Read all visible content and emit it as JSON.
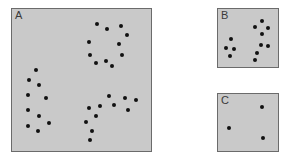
{
  "panels": [
    {
      "id": "A",
      "label": "A",
      "box": {
        "x": 11,
        "y": 8,
        "w": 141,
        "h": 144
      },
      "dots": [
        [
          97,
          24
        ],
        [
          107,
          29
        ],
        [
          121,
          26
        ],
        [
          127,
          35
        ],
        [
          89,
          42
        ],
        [
          119,
          44
        ],
        [
          90,
          55
        ],
        [
          122,
          55
        ],
        [
          96,
          63
        ],
        [
          106,
          61
        ],
        [
          112,
          66
        ],
        [
          36,
          70
        ],
        [
          29,
          80
        ],
        [
          39,
          85
        ],
        [
          28,
          95
        ],
        [
          46,
          98
        ],
        [
          28,
          110
        ],
        [
          39,
          116
        ],
        [
          49,
          123
        ],
        [
          28,
          126
        ],
        [
          38,
          131
        ],
        [
          109,
          96
        ],
        [
          125,
          98
        ],
        [
          136,
          100
        ],
        [
          100,
          106
        ],
        [
          114,
          105
        ],
        [
          128,
          110
        ],
        [
          89,
          108
        ],
        [
          96,
          116
        ],
        [
          86,
          122
        ],
        [
          92,
          131
        ],
        [
          90,
          140
        ]
      ]
    },
    {
      "id": "B",
      "label": "B",
      "box": {
        "x": 217,
        "y": 8,
        "w": 62,
        "h": 60
      },
      "dots": [
        [
          262,
          21
        ],
        [
          255,
          27
        ],
        [
          268,
          28
        ],
        [
          262,
          34
        ],
        [
          231,
          39
        ],
        [
          261,
          45
        ],
        [
          268,
          46
        ],
        [
          226,
          48
        ],
        [
          234,
          49
        ],
        [
          257,
          53
        ],
        [
          230,
          56
        ],
        [
          255,
          60
        ]
      ]
    },
    {
      "id": "C",
      "label": "C",
      "box": {
        "x": 217,
        "y": 93,
        "w": 62,
        "h": 59
      },
      "dots": [
        [
          262,
          107
        ],
        [
          229,
          128
        ],
        [
          263,
          138
        ]
      ]
    }
  ],
  "colors": {
    "panel_bg": "#c9c9c9",
    "border": "#6b6b6b",
    "dot": "#111111",
    "label": "#3a3a3a"
  }
}
